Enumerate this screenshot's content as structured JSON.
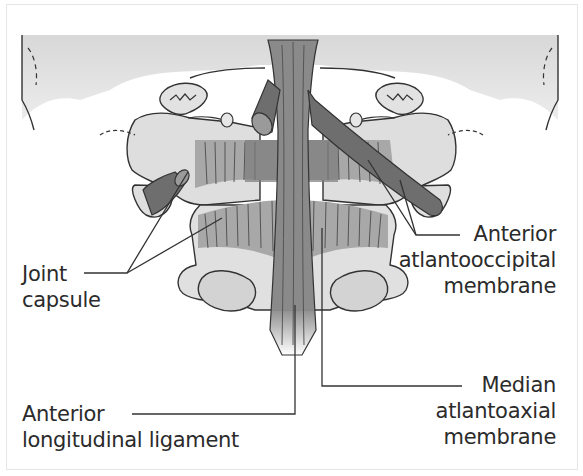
{
  "figure": {
    "colors": {
      "background_shade": "#e4e4e4",
      "bone_fill": "#dcdcdc",
      "membrane_fill": "#a9a9a9",
      "ligament_fill": "#8c8c8c",
      "ligament_dark": "#6f6f6f",
      "outline": "#333333",
      "text": "#2b2b2b"
    }
  },
  "labels": {
    "joint_capsule": {
      "line1": "Joint",
      "line2": "capsule"
    },
    "anterior_atlantooccipital_membrane": {
      "line1": "Anterior",
      "line2": "atlantooccipital",
      "line3": "membrane"
    },
    "median_atlantoaxial_membrane": {
      "line1": "Median",
      "line2": "atlantoaxial",
      "line3": "membrane"
    },
    "anterior_longitudinal_ligament": {
      "line1": "Anterior",
      "line2": "longitudinal ligament"
    }
  }
}
